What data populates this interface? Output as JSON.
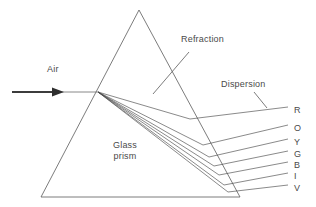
{
  "figure": {
    "labels": {
      "air": "Air",
      "refraction": "Refraction",
      "dispersion": "Dispersion",
      "glass": "Glass",
      "prism": "prism"
    },
    "spectrum": [
      {
        "letter": "R",
        "name": "red",
        "x": 294,
        "y": 106
      },
      {
        "letter": "O",
        "name": "orange",
        "x": 294,
        "y": 124
      },
      {
        "letter": "Y",
        "name": "yellow",
        "x": 294,
        "y": 138
      },
      {
        "letter": "G",
        "name": "green",
        "x": 294,
        "y": 150
      },
      {
        "letter": "B",
        "name": "blue",
        "x": 294,
        "y": 161
      },
      {
        "letter": "I",
        "name": "indigo",
        "x": 294,
        "y": 172
      },
      {
        "letter": "V",
        "name": "violet",
        "x": 294,
        "y": 184
      }
    ],
    "colors": {
      "stroke": "#555555",
      "text": "#4a4a4a",
      "background": "#ffffff",
      "ray": "#444444"
    },
    "geometry": {
      "prism": {
        "apex_x": 139,
        "apex_y": 10,
        "left_x": 41,
        "left_y": 197,
        "right_x": 240,
        "right_y": 197
      },
      "entry_point": {
        "x": 98,
        "y": 92
      },
      "incident_ray": {
        "x1": 12,
        "y1": 92,
        "x2": 98,
        "y2": 92
      }
    }
  }
}
